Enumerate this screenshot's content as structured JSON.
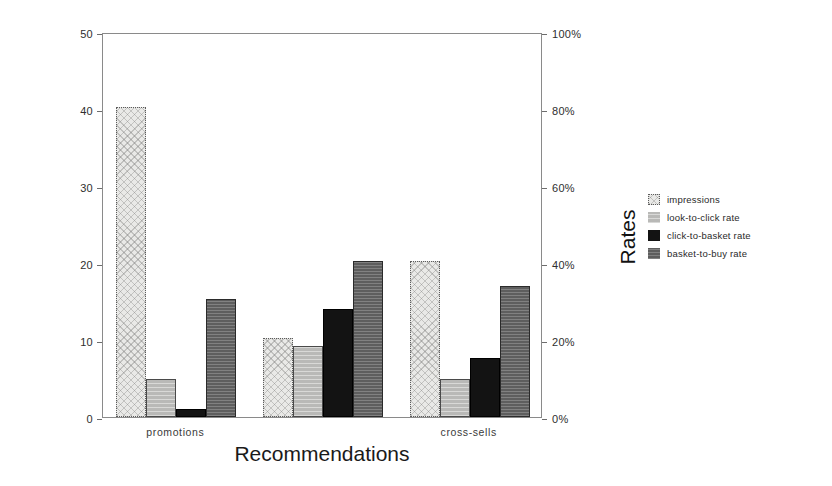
{
  "chart_data": {
    "type": "bar",
    "title": "",
    "subtitle": "",
    "xlabel": "Recommendations",
    "ylabel": "Impressions (1,000's)",
    "y2label": "Rates",
    "categories": [
      "promotions",
      "",
      "cross-sells"
    ],
    "series": [
      {
        "name": "impressions",
        "axis": "left",
        "unit": "1,000's",
        "color": "#e9e9e7",
        "pattern": "cross-hatch-light",
        "values": [
          40.2,
          10.2,
          20.2
        ]
      },
      {
        "name": "look-to-click rate",
        "axis": "right",
        "unit": "%",
        "color": "#b9b9b7",
        "pattern": "horizontal-lines-light",
        "values": [
          5.0,
          9.2,
          5.0
        ],
        "values_pct": [
          10,
          18,
          10
        ]
      },
      {
        "name": "click-to-basket rate",
        "axis": "right",
        "unit": "%",
        "color": "#131313",
        "pattern": "solid",
        "values": [
          1.1,
          14.0,
          7.6
        ],
        "values_pct": [
          2,
          28,
          15
        ]
      },
      {
        "name": "basket-to-buy rate",
        "axis": "right",
        "unit": "%",
        "color": "#5e5e5e",
        "pattern": "horizontal-lines-dark",
        "values": [
          15.3,
          20.2,
          17.0
        ],
        "values_pct": [
          31,
          40,
          34
        ]
      }
    ],
    "ylim": [
      0,
      50
    ],
    "yticks": [
      0,
      10,
      20,
      30,
      40,
      50
    ],
    "ytick_labels": [
      "0",
      "10",
      "20",
      "30",
      "40",
      "50"
    ],
    "y2lim": [
      0,
      100
    ],
    "y2ticks": [
      0,
      20,
      40,
      60,
      80,
      100
    ],
    "y2tick_labels": [
      "0%",
      "20%",
      "40%",
      "60%",
      "80%",
      "100%"
    ],
    "grid": false,
    "legend_position": "right",
    "legend": [
      "impressions",
      "look-to-click rate",
      "click-to-basket rate",
      "basket-to-buy rate"
    ],
    "group_count": 3,
    "bars_per_group": 4
  }
}
